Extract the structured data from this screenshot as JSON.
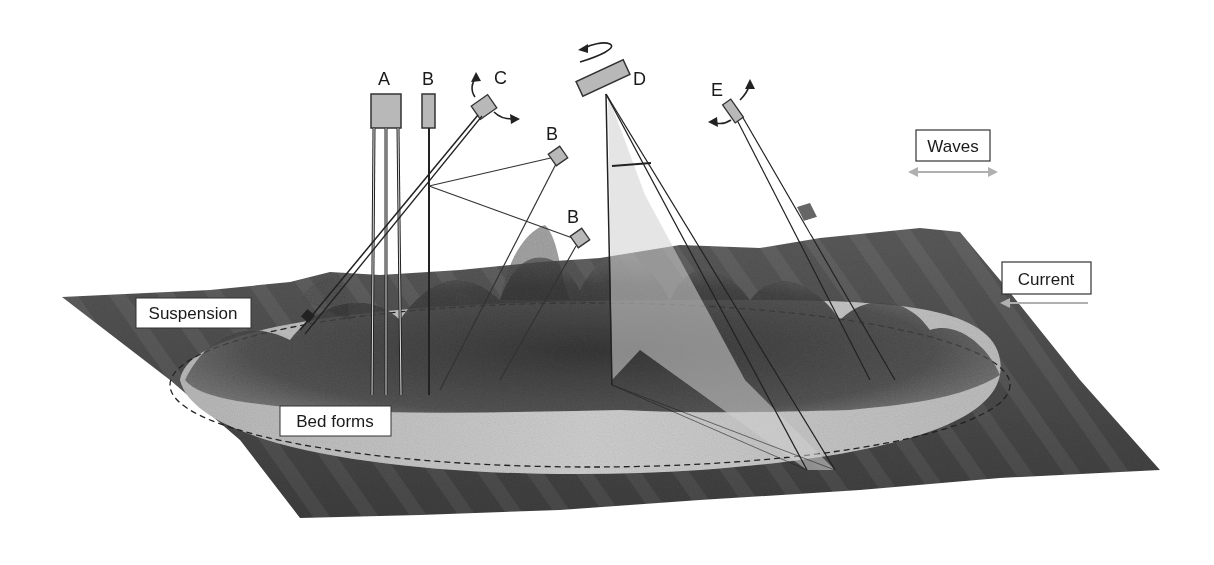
{
  "figure": {
    "instruments": [
      {
        "id": "A",
        "label": "A"
      },
      {
        "id": "B1",
        "label": "B"
      },
      {
        "id": "C",
        "label": "C"
      },
      {
        "id": "B2",
        "label": "B"
      },
      {
        "id": "B3",
        "label": "B"
      },
      {
        "id": "D",
        "label": "D"
      },
      {
        "id": "E",
        "label": "E"
      }
    ],
    "boxes": {
      "waves": "Waves",
      "current": "Current",
      "suspension": "Suspension",
      "bed_forms": "Bed forms"
    },
    "colors": {
      "seabed_dark": "#4a4a4a",
      "seabed_mid": "#6e6e6e",
      "bed_light": "#c4c4c4",
      "sensor_fill": "#b8b8b8",
      "arrow_gray": "#b0b0b0",
      "line": "#222222"
    }
  }
}
